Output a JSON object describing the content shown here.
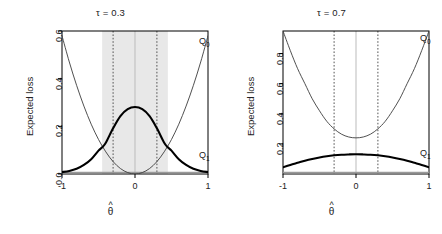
{
  "figure": {
    "axis_label_y": "Expected loss",
    "axis_label_x_base": "θ",
    "axis_label_x_hat": "^",
    "colors": {
      "axis": "#000000",
      "curve_thin": "#3c3c3c",
      "curve_thick": "#000000",
      "shade_band": "#e8e8e8",
      "dotted_line": "#555555",
      "center_line": "#bbbbbb",
      "baseline": "#9a9a9a"
    }
  },
  "panels": [
    {
      "id": "left",
      "title": "τ = 0.3",
      "tau": 0.3,
      "x_ticks": [
        "-1",
        "0",
        "1"
      ],
      "y_ticks": [
        "0.0",
        "0.2",
        "0.4",
        "0.6"
      ],
      "label_q0": "Q",
      "label_q0_sub": "0",
      "label_q1": "Q",
      "label_q1_sub": "1",
      "shaded": true
    },
    {
      "id": "right",
      "title": "τ = 0.7",
      "tau": 0.7,
      "x_ticks": [
        "-1",
        "0",
        "1"
      ],
      "y_ticks": [
        "0.2",
        "0.4",
        "0.6",
        "0.8"
      ],
      "label_q0": "Q",
      "label_q0_sub": "0",
      "label_q1": "Q",
      "label_q1_sub": "1",
      "shaded": false
    }
  ],
  "chart_data": [
    {
      "type": "line",
      "panel": "left",
      "title": "τ = 0.3",
      "xlabel": "θ̂",
      "ylabel": "Expected loss",
      "xlim": [
        -1,
        1
      ],
      "ylim": [
        0,
        0.6
      ],
      "xticks": [
        -1,
        0,
        1
      ],
      "yticks": [
        0.0,
        0.2,
        0.4,
        0.6
      ],
      "grid": false,
      "legend": "inline-curve-labels",
      "annotations": [
        {
          "text": "Q0",
          "x": 0.93,
          "y": 0.555
        },
        {
          "text": "Q1",
          "x": 0.93,
          "y": 0.075
        }
      ],
      "vlines_dotted": [
        -0.3,
        0.3
      ],
      "vline_center": [
        0.0
      ],
      "shaded_region": {
        "from": -0.45,
        "to": 0.45,
        "color": "#e8e8e8"
      },
      "series": [
        {
          "name": "Q0",
          "style": "thin",
          "x": [
            -1.0,
            -0.9,
            -0.8,
            -0.7,
            -0.6,
            -0.5,
            -0.4,
            -0.3,
            -0.2,
            -0.1,
            0.0,
            0.1,
            0.2,
            0.3,
            0.4,
            0.5,
            0.6,
            0.7,
            0.8,
            0.9,
            1.0
          ],
          "values": [
            0.58,
            0.47,
            0.372,
            0.285,
            0.209,
            0.145,
            0.093,
            0.052,
            0.023,
            0.006,
            0.0,
            0.006,
            0.023,
            0.052,
            0.093,
            0.145,
            0.209,
            0.285,
            0.372,
            0.47,
            0.58
          ]
        },
        {
          "name": "Q1",
          "style": "thick",
          "x": [
            -1.0,
            -0.9,
            -0.8,
            -0.7,
            -0.6,
            -0.5,
            -0.45,
            -0.4,
            -0.3,
            -0.2,
            -0.1,
            0.0,
            0.1,
            0.2,
            0.3,
            0.4,
            0.45,
            0.5,
            0.6,
            0.7,
            0.8,
            0.9,
            1.0
          ],
          "values": [
            0.008,
            0.013,
            0.022,
            0.038,
            0.062,
            0.098,
            0.112,
            0.131,
            0.192,
            0.243,
            0.272,
            0.281,
            0.272,
            0.243,
            0.192,
            0.131,
            0.112,
            0.098,
            0.062,
            0.038,
            0.022,
            0.013,
            0.008
          ]
        }
      ]
    },
    {
      "type": "line",
      "panel": "right",
      "title": "τ = 0.7",
      "xlabel": "θ̂",
      "ylabel": "Expected loss",
      "xlim": [
        -1,
        1
      ],
      "ylim": [
        0,
        0.95
      ],
      "xticks": [
        -1,
        0,
        1
      ],
      "yticks": [
        0.2,
        0.4,
        0.6,
        0.8
      ],
      "grid": false,
      "legend": "inline-curve-labels",
      "annotations": [
        {
          "text": "Q0",
          "x": 0.93,
          "y": 0.9
        },
        {
          "text": "Q1",
          "x": 0.93,
          "y": 0.135
        }
      ],
      "vlines_dotted": [
        -0.3,
        0.3
      ],
      "vline_center": [
        0.0
      ],
      "shaded_region": null,
      "series": [
        {
          "name": "Q0",
          "style": "thin",
          "x": [
            -1.0,
            -0.9,
            -0.8,
            -0.7,
            -0.6,
            -0.5,
            -0.4,
            -0.3,
            -0.2,
            -0.1,
            0.0,
            0.1,
            0.2,
            0.3,
            0.4,
            0.5,
            0.6,
            0.7,
            0.8,
            0.9,
            1.0
          ],
          "values": [
            0.95,
            0.82,
            0.7,
            0.6,
            0.5,
            0.42,
            0.35,
            0.3,
            0.265,
            0.246,
            0.24,
            0.246,
            0.265,
            0.3,
            0.35,
            0.42,
            0.5,
            0.6,
            0.7,
            0.82,
            0.95
          ]
        },
        {
          "name": "Q1",
          "style": "thick",
          "x": [
            -1.0,
            -0.9,
            -0.8,
            -0.7,
            -0.6,
            -0.5,
            -0.4,
            -0.3,
            -0.2,
            -0.1,
            0.0,
            0.1,
            0.2,
            0.3,
            0.4,
            0.5,
            0.6,
            0.7,
            0.8,
            0.9,
            1.0
          ],
          "values": [
            0.045,
            0.06,
            0.074,
            0.088,
            0.1,
            0.11,
            0.118,
            0.124,
            0.128,
            0.13,
            0.131,
            0.13,
            0.128,
            0.124,
            0.118,
            0.11,
            0.1,
            0.088,
            0.074,
            0.06,
            0.045
          ]
        }
      ]
    }
  ]
}
